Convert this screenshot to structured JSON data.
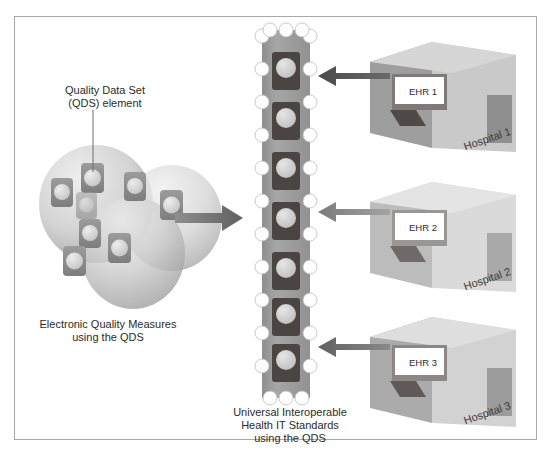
{
  "diagram": {
    "title": "Universal Interoperable Health IT Standards using the QDS",
    "frame_border_color": "#a8a8a8",
    "background": "#ffffff"
  },
  "labels": {
    "qds_element": "Quality Data Set\n(QDS) element",
    "electronic_quality_measures": "Electronic Quality Measures\nusing the QDS",
    "universal_standards": "Universal Interoperable\nHealth IT Standards\nusing the QDS"
  },
  "measures_cluster": {
    "name": "electronic-quality-measures-cluster",
    "circle_count": 3,
    "element_count": 8,
    "circle_fill_light": "#e3e3e3",
    "circle_fill_dark": "#9a9a9a",
    "element_fill": "#8c8c8c",
    "element_dot_fill": "#d8d8d8"
  },
  "standards_column": {
    "name": "universal-standards-column",
    "body_fill": "#9d9d9d",
    "edge_dot_fill": "#ffffff",
    "slot_fill": "#4a4542",
    "slot_dot_fill": "#d2d2d2",
    "slot_count": 7,
    "edge_dots_per_side": 11
  },
  "flow_arrow": {
    "name": "measures-to-standards-arrow",
    "direction": "right",
    "color": "#6f6f6f"
  },
  "hospitals": [
    {
      "id": 1,
      "label": "Hospital 1",
      "ehr_label": "EHR 1",
      "arrow_label": "ehr-1-to-standards-arrow",
      "front_fill": "#9e9e9e",
      "side_fill": "#c9c9c9",
      "top_fill": "#d6d6d6",
      "door_fill": "#8f8f8f",
      "screen_fill": "#ffffff",
      "arrow_color": "#5d5d5d"
    },
    {
      "id": 2,
      "label": "Hospital 2",
      "ehr_label": "EHR 2",
      "arrow_label": "ehr-2-to-standards-arrow",
      "front_fill": "#bcbcbc",
      "side_fill": "#dadada",
      "top_fill": "#e4e4e4",
      "door_fill": "#a9a9a9",
      "screen_fill": "#ffffff",
      "arrow_color": "#8a8a8a"
    },
    {
      "id": 3,
      "label": "Hospital 3",
      "ehr_label": "EHR 3",
      "arrow_label": "ehr-3-to-standards-arrow",
      "front_fill": "#ababab",
      "side_fill": "#d2d2d2",
      "top_fill": "#dedede",
      "door_fill": "#9b9b9b",
      "screen_fill": "#ffffff",
      "arrow_color": "#6f6f6f"
    }
  ]
}
